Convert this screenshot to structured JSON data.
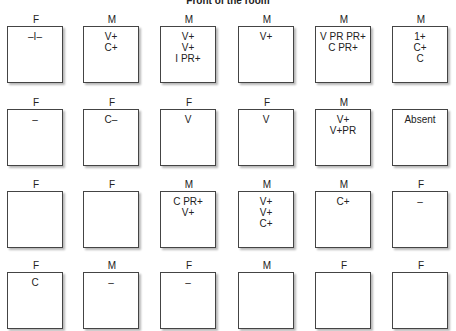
{
  "title": "Front of the room",
  "rows": [
    [
      {
        "sex": "F",
        "notes": [
          "–I–"
        ]
      },
      {
        "sex": "M",
        "notes": [
          "V+",
          "C+"
        ]
      },
      {
        "sex": "M",
        "notes": [
          "V+",
          "V+",
          "I PR+"
        ]
      },
      {
        "sex": "M",
        "notes": [
          "V+"
        ]
      },
      {
        "sex": "M",
        "notes": [
          "V PR PR+",
          "C PR+"
        ]
      },
      {
        "sex": "M",
        "notes": [
          "1+",
          "C+",
          "C"
        ]
      }
    ],
    [
      {
        "sex": "F",
        "notes": [
          "–"
        ]
      },
      {
        "sex": "F",
        "notes": [
          "C–"
        ]
      },
      {
        "sex": "F",
        "notes": [
          "V"
        ]
      },
      {
        "sex": "F",
        "notes": [
          "V"
        ]
      },
      {
        "sex": "M",
        "notes": [
          "V+",
          "V+PR"
        ]
      },
      {
        "sex": "",
        "notes": [
          "Absent"
        ]
      }
    ],
    [
      {
        "sex": "F",
        "notes": []
      },
      {
        "sex": "F",
        "notes": []
      },
      {
        "sex": "M",
        "notes": [
          "C PR+",
          "V+"
        ]
      },
      {
        "sex": "M",
        "notes": [
          "V+",
          "V+",
          "C+"
        ]
      },
      {
        "sex": "M",
        "notes": [
          "C+"
        ]
      },
      {
        "sex": "F",
        "notes": [
          "–"
        ]
      }
    ],
    [
      {
        "sex": "F",
        "notes": [
          "C"
        ]
      },
      {
        "sex": "M",
        "notes": [
          "–"
        ]
      },
      {
        "sex": "F",
        "notes": [
          "–"
        ]
      },
      {
        "sex": "M",
        "notes": []
      },
      {
        "sex": "F",
        "notes": []
      },
      {
        "sex": "F",
        "notes": []
      }
    ]
  ]
}
